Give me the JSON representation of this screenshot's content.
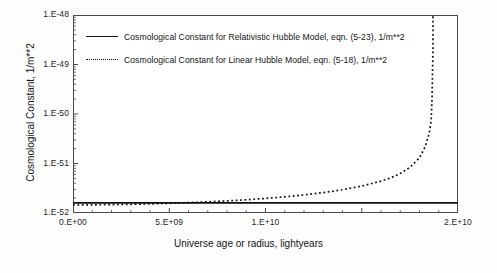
{
  "chart_data": {
    "type": "line",
    "title": "",
    "xlabel": "Universe age or radius, lightyears",
    "ylabel": "Cosmological Constant, 1/m**2",
    "xlim": [
      0,
      20000000000
    ],
    "ylim": [
      1e-52,
      1e-48
    ],
    "yscale": "log",
    "xscale": "linear",
    "grid": false,
    "legend_position": "upper-left-inside",
    "xticks": [
      {
        "value": 0,
        "label": "0.E+00"
      },
      {
        "value": 5000000000,
        "label": "5.E+09"
      },
      {
        "value": 10000000000,
        "label": "1.E+10"
      },
      {
        "value": 20000000000,
        "label": "2.E+10"
      }
    ],
    "yticks": [
      {
        "value": 1e-48,
        "label": "1.E-48"
      },
      {
        "value": 1e-49,
        "label": "1.E-49"
      },
      {
        "value": 1e-50,
        "label": "1.E-50"
      },
      {
        "value": 1e-51,
        "label": "1.E-51"
      },
      {
        "value": 1e-52,
        "label": "1.E-52"
      }
    ],
    "series": [
      {
        "name": "Cosmological Constant for Relativistic Hubble Model, eqn. (5-23), 1/m**2",
        "style": "solid",
        "color": "#111111",
        "x": [
          0,
          2000000000,
          4000000000,
          6000000000,
          8000000000,
          10000000000,
          12000000000,
          14000000000,
          16000000000,
          18000000000,
          20000000000
        ],
        "y": [
          1.6e-52,
          1.6e-52,
          1.6e-52,
          1.6e-52,
          1.6e-52,
          1.6e-52,
          1.6e-52,
          1.6e-52,
          1.6e-52,
          1.6e-52,
          1.6e-52
        ]
      },
      {
        "name": "Cosmological Constant for Linear Hubble Model, eqn. (5-18), 1/m**2",
        "style": "dotted",
        "color": "#111111",
        "x": [
          0,
          1000000000,
          2000000000,
          3000000000,
          4000000000,
          5000000000,
          6000000000,
          7000000000,
          8000000000,
          9000000000,
          10000000000,
          11000000000,
          12000000000,
          13000000000,
          14000000000,
          15000000000,
          16000000000,
          16500000000,
          17000000000,
          17500000000,
          18000000000,
          18300000000,
          18500000000,
          18600000000,
          18650000000,
          18700000000,
          18700000000
        ],
        "y": [
          1.45e-52,
          1.46e-52,
          1.48e-52,
          1.5e-52,
          1.53e-52,
          1.57e-52,
          1.62e-52,
          1.68e-52,
          1.76e-52,
          1.85e-52,
          1.97e-52,
          2.12e-52,
          2.32e-52,
          2.58e-52,
          2.95e-52,
          3.5e-52,
          4.4e-52,
          5.1e-52,
          6.3e-52,
          8.3e-52,
          1.3e-51,
          2.2e-51,
          4e-51,
          7e-51,
          2e-50,
          2e-49,
          1e-48
        ]
      }
    ]
  },
  "legend": {
    "entries": [
      {
        "sample": "solid-line-sample",
        "label": "Cosmological Constant for Relativistic Hubble Model, eqn. (5-23), 1/m**2"
      },
      {
        "sample": "dotted-line-sample",
        "label": "Cosmological Constant for Linear Hubble Model, eqn. (5-18), 1/m**2"
      }
    ]
  },
  "axes": {
    "x_title": "Universe age or radius, lightyears",
    "y_title": "Cosmological Constant, 1/m**2",
    "x_labels": [
      "0.E+00",
      "5.E+09",
      "1.E+10",
      "2.E+10"
    ],
    "y_labels": [
      "1.E-48",
      "1.E-49",
      "1.E-50",
      "1.E-51",
      "1.E-52"
    ]
  }
}
